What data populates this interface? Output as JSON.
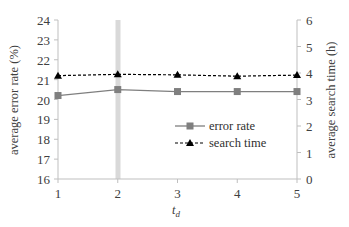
{
  "chart_data": {
    "type": "line",
    "title": "",
    "xlabel": "t_d",
    "ylabel": "average error rate (%)",
    "y2label": "average search time (h)",
    "x": [
      1,
      2,
      3,
      4,
      5
    ],
    "xticks": [
      "1",
      "2",
      "3",
      "4",
      "5"
    ],
    "ylim": [
      16,
      24
    ],
    "yticks": [
      "16",
      "17",
      "18",
      "19",
      "20",
      "21",
      "22",
      "23",
      "24"
    ],
    "y2lim": [
      0,
      6
    ],
    "y2ticks": [
      "0",
      "1",
      "2",
      "3",
      "4",
      "5",
      "6"
    ],
    "grid": false,
    "legend_position": "center-right",
    "highlight_x": 2,
    "series": [
      {
        "name": "error rate",
        "axis": "left",
        "marker": "square",
        "line": "solid",
        "color": "#7f7f7f",
        "values": [
          20.2,
          20.5,
          20.4,
          20.4,
          20.4
        ]
      },
      {
        "name": "search time",
        "axis": "right",
        "marker": "triangle",
        "line": "dashed",
        "color": "#000000",
        "values": [
          3.9,
          3.95,
          3.93,
          3.88,
          3.92
        ]
      }
    ]
  },
  "labels": {
    "ylabel": "average error rate (%)",
    "y2label": "average search time (h)",
    "xlabel_main": "t",
    "xlabel_sub": "d",
    "legend_error": "error rate",
    "legend_search": "search time"
  }
}
